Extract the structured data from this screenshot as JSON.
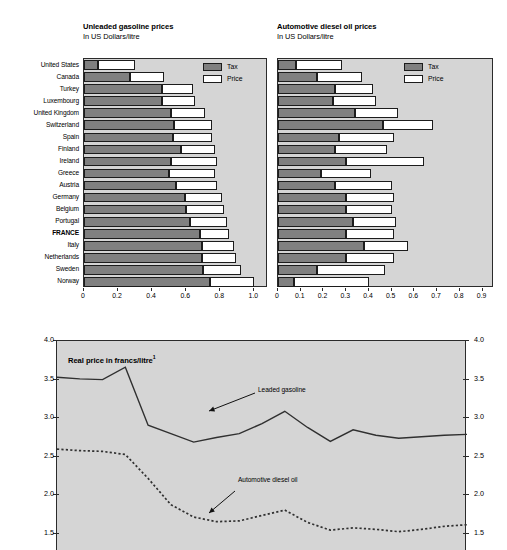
{
  "figure": {
    "top_cut_text": "",
    "background": "#ffffff",
    "plot_background": "#d5d5d5",
    "tax_color": "#808080",
    "price_color": "#ffffff",
    "frame_color": "#2b2b2b"
  },
  "bar_charts": {
    "legend": {
      "tax_label": "Tax",
      "price_label": "Price"
    },
    "left": {
      "title": "Unleaded gasoline prices",
      "subtitle": "In US Dollars/litre"
    },
    "right": {
      "title": "Automotive diesel oil prices",
      "subtitle": "In US Dollars/litre"
    }
  },
  "line_chart": {
    "title": "Real price in francs/litre",
    "title_footnote": "1",
    "annotations": [
      {
        "label": "Leaded gasoline"
      },
      {
        "label": "Automotive diesel oil"
      }
    ]
  },
  "chart_data": [
    {
      "type": "bar",
      "orientation": "horizontal",
      "stacked": true,
      "title": "Unleaded gasoline prices",
      "subtitle": "In US Dollars/litre",
      "xlabel": "",
      "ylabel": "",
      "xlim": [
        0,
        1.08
      ],
      "xticks": [
        0,
        0.2,
        0.4,
        0.6,
        0.8,
        1.0
      ],
      "xticklabels": [
        "0",
        "0.2",
        "0.4",
        "0.6",
        "0.8",
        "1.0"
      ],
      "grid": false,
      "legend": [
        "Tax",
        "Price"
      ],
      "legend_position": "top-right",
      "categories": [
        "United States",
        "Canada",
        "Turkey",
        "Luxembourg",
        "United Kingdom",
        "Switzerland",
        "Spain",
        "Finland",
        "Ireland",
        "Greece",
        "Austria",
        "Germany",
        "Belgium",
        "Portugal",
        "FRANCE",
        "Italy",
        "Netherlands",
        "Sweden",
        "Norway"
      ],
      "highlight_category": "FRANCE",
      "series": [
        {
          "name": "Tax",
          "values": [
            0.08,
            0.27,
            0.46,
            0.46,
            0.51,
            0.53,
            0.52,
            0.57,
            0.51,
            0.5,
            0.54,
            0.59,
            0.6,
            0.62,
            0.68,
            0.69,
            0.69,
            0.7,
            0.74
          ]
        },
        {
          "name": "Price",
          "values": [
            0.22,
            0.2,
            0.18,
            0.19,
            0.2,
            0.22,
            0.23,
            0.2,
            0.27,
            0.27,
            0.24,
            0.22,
            0.22,
            0.22,
            0.17,
            0.19,
            0.2,
            0.22,
            0.26
          ]
        }
      ],
      "totals": [
        0.3,
        0.47,
        0.64,
        0.65,
        0.71,
        0.75,
        0.75,
        0.77,
        0.78,
        0.77,
        0.78,
        0.81,
        0.82,
        0.84,
        0.85,
        0.88,
        0.89,
        0.92,
        1.0
      ]
    },
    {
      "type": "bar",
      "orientation": "horizontal",
      "stacked": true,
      "title": "Automotive diesel oil prices",
      "subtitle": "In US Dollars/litre",
      "xlabel": "",
      "ylabel": "",
      "xlim": [
        0,
        0.95
      ],
      "xticks": [
        0,
        0.1,
        0.2,
        0.3,
        0.4,
        0.5,
        0.6,
        0.7,
        0.8,
        0.9
      ],
      "xticklabels": [
        "0",
        "0.1",
        "0.2",
        "0.3",
        "0.4",
        "0.5",
        "0.6",
        "0.7",
        "0.8",
        "0.9"
      ],
      "grid": false,
      "legend": [
        "Tax",
        "Price"
      ],
      "legend_position": "top-right",
      "categories": [
        "United States",
        "Canada",
        "Turkey",
        "Luxembourg",
        "United Kingdom",
        "Switzerland",
        "Spain",
        "Finland",
        "Ireland",
        "Greece",
        "Austria",
        "Germany",
        "Belgium",
        "Portugal",
        "FRANCE",
        "Italy",
        "Netherlands",
        "Sweden",
        "Norway"
      ],
      "highlight_category": "FRANCE",
      "series": [
        {
          "name": "Tax",
          "values": [
            0.08,
            0.17,
            0.25,
            0.24,
            0.34,
            0.46,
            0.27,
            0.25,
            0.3,
            0.19,
            0.25,
            0.3,
            0.3,
            0.33,
            0.3,
            0.38,
            0.3,
            0.17,
            0.07
          ]
        },
        {
          "name": "Price",
          "values": [
            0.2,
            0.2,
            0.17,
            0.19,
            0.19,
            0.22,
            0.24,
            0.23,
            0.34,
            0.22,
            0.25,
            0.21,
            0.2,
            0.19,
            0.21,
            0.19,
            0.21,
            0.3,
            0.33
          ]
        }
      ],
      "totals": [
        0.28,
        0.37,
        0.42,
        0.43,
        0.53,
        0.68,
        0.51,
        0.48,
        0.64,
        0.41,
        0.5,
        0.51,
        0.5,
        0.52,
        0.51,
        0.57,
        0.51,
        0.47,
        0.4
      ]
    },
    {
      "type": "line",
      "title": "Real price in francs/litre",
      "xlabel": "",
      "ylabel": "",
      "ylim": [
        1.28,
        4.0
      ],
      "yticks": [
        1.5,
        2.0,
        2.5,
        3.0,
        3.5,
        4.0
      ],
      "yticklabels": [
        "1.5",
        "2.0",
        "2.5",
        "3.0",
        "3.5",
        "4.0"
      ],
      "yticks_right": [
        1.5,
        2.0,
        2.5,
        3.0,
        3.5,
        4.0
      ],
      "yticklabels_right": [
        "1.5",
        "2.0",
        "2.5",
        "3.0",
        "3.5",
        "4.0"
      ],
      "grid": false,
      "legend_position": "inline-annotation",
      "x": [
        0,
        1,
        2,
        3,
        4,
        5,
        6,
        7,
        8,
        9,
        10,
        11,
        12,
        13,
        14,
        15,
        16,
        17,
        18
      ],
      "series": [
        {
          "name": "Leaded gasoline",
          "style": "solid",
          "values": [
            3.53,
            3.51,
            3.5,
            3.66,
            2.91,
            2.8,
            2.69,
            2.75,
            2.8,
            2.93,
            3.09,
            2.88,
            2.7,
            2.85,
            2.78,
            2.74,
            2.76,
            2.78,
            2.79
          ]
        },
        {
          "name": "Automotive diesel oil",
          "style": "dotted",
          "values": [
            2.6,
            2.58,
            2.57,
            2.53,
            2.22,
            1.88,
            1.72,
            1.66,
            1.67,
            1.74,
            1.81,
            1.65,
            1.55,
            1.58,
            1.56,
            1.53,
            1.56,
            1.6,
            1.62
          ]
        }
      ]
    }
  ]
}
